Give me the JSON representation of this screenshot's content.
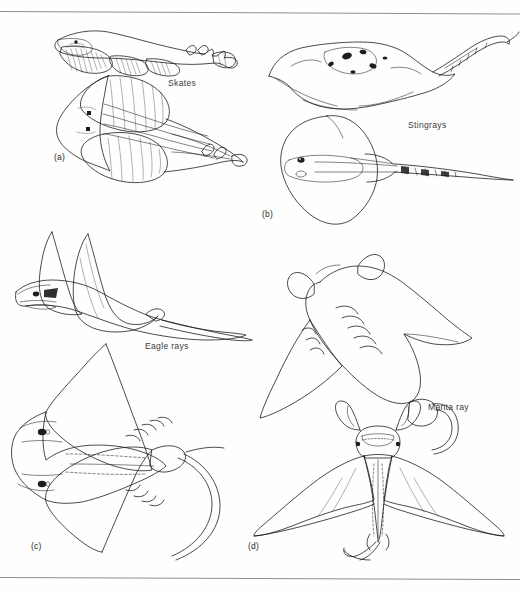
{
  "figure": {
    "ink_color": "#1d1d1d",
    "background_color": "#ffffff",
    "rule_color": "#8e8e8e"
  },
  "panels": [
    {
      "letter": "(a)",
      "label": "Skates",
      "views": [
        "lateral oblique view",
        "dorsal view"
      ],
      "traits": "elongate slender tail with two small dorsal fins, rounded rhomboid disc, spiracles behind eyes"
    },
    {
      "letter": "(b)",
      "label": "Stingrays",
      "views": [
        "oblique dorsal view",
        "dorsal view"
      ],
      "traits": "thick whip-like tail bearing a serrated sting, heavily stippled disc, no dorsal fins"
    },
    {
      "letter": "(c)",
      "label": "Eagle rays",
      "views": [
        "lateral oblique view",
        "ventral view"
      ],
      "traits": "pointed angular pectoral wings, distinct protruding head, long whip tail, five gill slits visible"
    },
    {
      "letter": "(d)",
      "label": "Manta ray",
      "views": [
        "oblique dorsal view",
        "ventral view"
      ],
      "traits": "cephalic lobes flanking a terminal mouth, very broad falcate wings, short slender tail, five gill slits"
    }
  ],
  "rules": {
    "top": "horizontal rule near top of plate",
    "bottom": "horizontal rule near bottom of plate"
  }
}
